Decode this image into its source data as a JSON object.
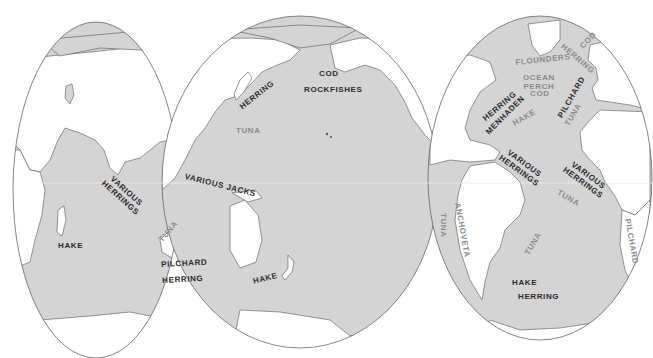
{
  "map": {
    "title": "World Fishing Grounds",
    "projection": "Interrupted (lobed) equal-area",
    "colors": {
      "ocean": "#d4d4d4",
      "land": "#ffffff",
      "outline": "#555555",
      "label_dark": "#2b2b2b",
      "label_light": "#8a8a8a"
    },
    "labels": {
      "indian_various_herrings": "VARIOUS\nHERRINGS",
      "indian_hake": "HAKE",
      "indian_tuna": "TUNA",
      "australia_pilchard": "PILCHARD",
      "australia_herring": "HERRING",
      "various_jacks": "VARIOUS JACKS",
      "pacific_herring": "HERRING",
      "pacific_cod": "COD",
      "pacific_rockfishes": "ROCKFISHES",
      "pacific_tuna": "TUNA",
      "nz_hake": "HAKE",
      "anchoveta": "ANCHOVETA",
      "peru_tuna": "TUNA",
      "atl_herring": "HERRING",
      "atl_menhaden": "MENHADEN",
      "atl_flounders": "FLOUNDERS",
      "atl_ocean_perch": "OCEAN\nPERCH",
      "atl_cod": "COD",
      "atl_hake": "HAKE",
      "atl_pilchard": "PILCHARD",
      "atl_tuna": "TUNA",
      "north_sea_herring": "HERRING",
      "north_sea_cod": "COD",
      "brazil_various_herrings": "VARIOUS\nHERRINGS",
      "africa_various_herrings": "VARIOUS\nHERRINGS",
      "sa_tuna_mid": "TUNA",
      "sa_tuna_east": "TUNA",
      "sw_africa_pilchard": "PILCHARD",
      "argentina_hake": "HAKE",
      "argentina_herring": "HERRING"
    }
  }
}
